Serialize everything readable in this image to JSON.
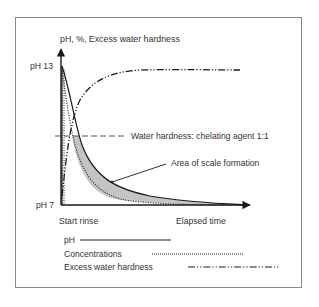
{
  "figure": {
    "y_axis_label": "pH, %, Excess water hardness",
    "y_tick_top": "pH 13",
    "y_tick_bottom": "pH 7",
    "x_tick_start": "Start rinse",
    "x_label": "Elapsed time",
    "reference_line_label": "Water hardness: chelating agent 1:1",
    "area_annotation": "Area of scale formation"
  },
  "legend": {
    "items": [
      {
        "label": "pH",
        "style": "solid"
      },
      {
        "label": "Concentrations",
        "style": "dotted"
      },
      {
        "label": "Excess water hardness",
        "style": "dash-dot-dot"
      }
    ]
  },
  "colors": {
    "line": "#1a1a1a",
    "shaded_area": "#c4c4c4",
    "frame": "#8a8a8a",
    "text": "#333333"
  }
}
